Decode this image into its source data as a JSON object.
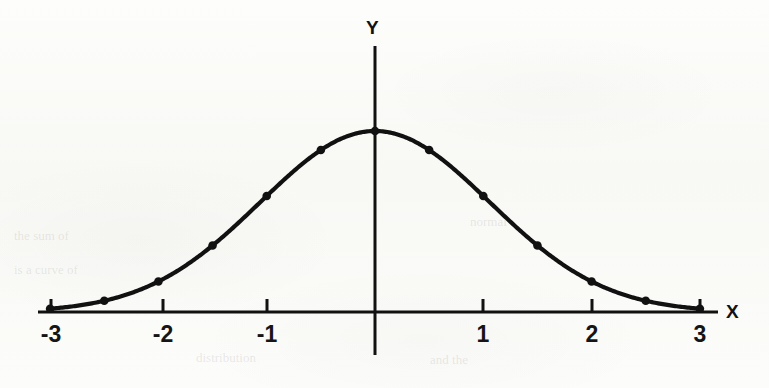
{
  "figure": {
    "background_color": "#fbfbf9",
    "ink_color": "#111111"
  },
  "axis_labels": {
    "x": "X",
    "y": "Y"
  },
  "x_tick_labels": [
    "-3",
    "-2",
    "-1",
    "1",
    "2",
    "3"
  ],
  "ghost_marks": [
    "the sum of",
    "is a curve of",
    "normal",
    "distribution",
    "and the"
  ],
  "chart_data": {
    "type": "line",
    "title": "",
    "subtitle": "",
    "xlabel": "X",
    "ylabel": "Y",
    "xlim": [
      -3.15,
      3.15
    ],
    "ylim": [
      0,
      1.06
    ],
    "grid": false,
    "legend": null,
    "markers": true,
    "marker_style": "filled-circle",
    "x": [
      -3,
      -2.5,
      -2,
      -1.5,
      -1,
      -0.5,
      0,
      0.5,
      1,
      1.5,
      2,
      2.5,
      3
    ],
    "y": [
      0.05,
      0.08,
      0.14,
      0.33,
      0.6,
      0.89,
      1.0,
      0.89,
      0.6,
      0.33,
      0.14,
      0.08,
      0.05
    ],
    "x_ticks": [
      -3,
      -2,
      -1,
      1,
      2,
      3
    ],
    "y_ticks": []
  }
}
